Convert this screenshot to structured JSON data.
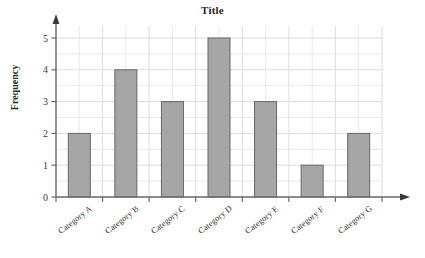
{
  "chart_data": {
    "type": "bar",
    "title": "Title",
    "xlabel": "",
    "ylabel": "Frequency",
    "categories": [
      "Category A",
      "Category B",
      "Category C",
      "Category D",
      "Category E",
      "Category F",
      "Category G"
    ],
    "values": [
      2,
      4,
      3,
      5,
      3,
      1,
      2
    ],
    "ylim": [
      0,
      5
    ],
    "yticks": [
      0,
      1,
      2,
      3,
      4,
      5
    ],
    "ytick_labels": [
      "0",
      "1",
      "2",
      "3",
      "4",
      "5"
    ],
    "grid": true,
    "grid_minor_step": 0.5,
    "legend": null,
    "legend_position": "none",
    "bar_fill_color": "#a6a6a6",
    "bar_edge_color": "#666666",
    "grid_color": "#e9e9ee",
    "grid_major_color": "#dcdce4",
    "axis_color": "#6b6b6b",
    "axes_arrows": true
  }
}
